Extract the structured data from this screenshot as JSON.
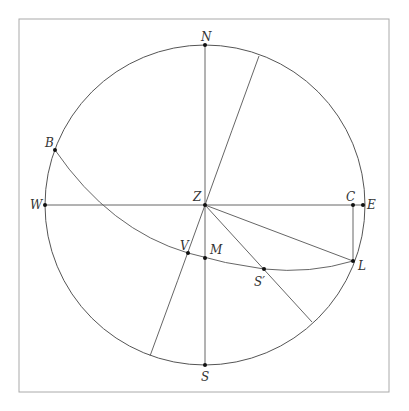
{
  "diagram": {
    "type": "celestial-sphere-projection",
    "frame": {
      "x": 19,
      "y": 19,
      "width": 370,
      "height": 373,
      "stroke": "#aaaaaa"
    },
    "circle": {
      "cx": 205,
      "cy": 205,
      "r": 160,
      "stroke": "#555555"
    },
    "line_color": "#666666",
    "point_color": "#111111",
    "points": [
      {
        "id": "N",
        "label": "N",
        "x": 205,
        "y": 45,
        "lx": 201,
        "ly": 41
      },
      {
        "id": "S",
        "label": "S",
        "x": 205,
        "y": 365,
        "lx": 201,
        "ly": 381
      },
      {
        "id": "W",
        "label": "W",
        "x": 45,
        "y": 205,
        "lx": 30,
        "ly": 209
      },
      {
        "id": "E",
        "label": "E",
        "x": 363,
        "y": 205,
        "lx": 367,
        "ly": 209
      },
      {
        "id": "Z",
        "label": "Z",
        "x": 205,
        "y": 205,
        "lx": 193,
        "ly": 201
      },
      {
        "id": "C",
        "label": "C",
        "x": 353,
        "y": 205,
        "lx": 346,
        "ly": 201
      },
      {
        "id": "L",
        "label": "L",
        "x": 353,
        "y": 261,
        "lx": 358,
        "ly": 270
      },
      {
        "id": "B",
        "label": "B",
        "x": 55,
        "y": 150,
        "lx": 45,
        "ly": 147
      },
      {
        "id": "V",
        "label": "V",
        "x": 188,
        "y": 253,
        "lx": 180,
        "ly": 250
      },
      {
        "id": "M",
        "label": "M",
        "x": 205,
        "y": 258,
        "lx": 210,
        "ly": 254
      },
      {
        "id": "S_prime",
        "label": "S′",
        "x": 264,
        "y": 269,
        "lx": 254,
        "ly": 286
      }
    ],
    "segments": [
      {
        "name": "meridian-N-S",
        "from": "N",
        "to": "S"
      },
      {
        "name": "horizon-W-E",
        "from": "W",
        "to": "E"
      },
      {
        "name": "segment-Z-L",
        "from": "Z",
        "to": "L"
      },
      {
        "name": "segment-C-L",
        "from": "C",
        "to": "L"
      },
      {
        "name": "ray-Z-S-prime",
        "from": [
          205,
          205
        ],
        "to": [
          312,
          322
        ]
      }
    ],
    "arcs": [
      {
        "name": "arc-B-V-M-S-prime-L",
        "path": "M55,150 Q110,230 188,253 Q225,264 264,269 Q310,274 353,261"
      },
      {
        "name": "arc-through-Z",
        "path": "M150,356 Q178,280 205,205 Q232,130 259,56"
      }
    ]
  }
}
